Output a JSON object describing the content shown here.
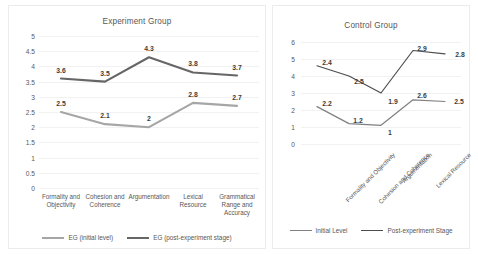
{
  "chart_data": [
    {
      "id": "experiment-group",
      "type": "line",
      "title": "Experiment Group",
      "xlabel": "",
      "ylabel": "",
      "ylim": [
        0,
        5
      ],
      "ytick_labels": [
        "5",
        "4.5",
        "4",
        "3.5",
        "3",
        "2.5",
        "2",
        "1.5",
        "1",
        "0.5",
        "0"
      ],
      "ytick_values": [
        5,
        4.5,
        4,
        3.5,
        3,
        2.5,
        2,
        1.5,
        1,
        0.5,
        0
      ],
      "grid": true,
      "legend_position": "bottom",
      "categories": [
        "Formality and Objectivity",
        "Cohesion and Coherence",
        "Argumentation",
        "Lexical Resource",
        "Grammatical Range and Accuracy"
      ],
      "series": [
        {
          "name": "EG (initial level)",
          "color": "#a6a6a6",
          "values": [
            2.5,
            2.1,
            2.0,
            2.8,
            2.7
          ],
          "labels": [
            "2.5",
            "2.1",
            "2",
            "2.8",
            "2.7"
          ]
        },
        {
          "name": "EG (post-experiment stage)",
          "color": "#666666",
          "values": [
            3.6,
            3.5,
            4.3,
            3.8,
            3.7
          ],
          "labels": [
            "3.6",
            "3.5",
            "4.3",
            "3.8",
            "3.7"
          ]
        }
      ]
    },
    {
      "id": "control-group",
      "type": "line",
      "title": "Control Group",
      "xlabel": "",
      "ylabel": "",
      "ylim": [
        0,
        6
      ],
      "ytick_labels": [
        "6",
        "5",
        "4",
        "3",
        "2",
        "1",
        "0"
      ],
      "ytick_values": [
        6,
        5,
        4,
        3,
        2,
        1,
        0
      ],
      "grid": true,
      "legend_position": "bottom",
      "categories": [
        "Formality and Objectivity",
        "Cohesion and Coherence",
        "Argumentation",
        "Lexical Resource",
        "Grammatical Range and Accuracy"
      ],
      "series": [
        {
          "name": "Initial Level",
          "color": "#808080",
          "values": [
            2.2,
            1.2,
            1.1,
            2.6,
            2.5
          ],
          "labels": [
            "2.2",
            "1.2",
            "1",
            "2.6",
            "2.5"
          ]
        },
        {
          "name": "Post-experiment Stage",
          "color": "#4d4d4d",
          "values": [
            4.6,
            4.0,
            3.0,
            5.5,
            5.3
          ],
          "labels": [
            "2.4",
            "2.5",
            "1.9",
            "2.9",
            "2.8"
          ]
        }
      ]
    }
  ]
}
